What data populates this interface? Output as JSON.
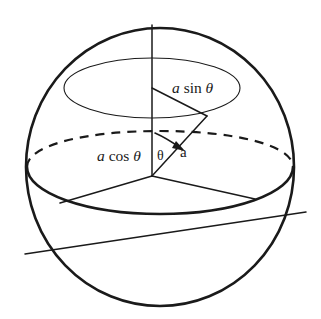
{
  "figure": {
    "kind": "geometry-diagram",
    "background_color": "#ffffff",
    "ink_color": "#1a1a1a",
    "labels": {
      "a_sin_theta": {
        "var1": "a",
        "fn": "sin",
        "var2": "θ",
        "full": "a sin θ"
      },
      "a_cos_theta": {
        "var1": "a",
        "fn": "cos",
        "var2": "θ",
        "full": "a cos θ"
      },
      "theta": {
        "full": "θ"
      },
      "a": {
        "full": "a"
      }
    },
    "parts": {
      "sphere_outline": "sphere-outline-circle",
      "equator_front": "equator-front-arc",
      "equator_back": "equator-back-dashed-arc",
      "latitude_circle": "latitude-circle-ellipse",
      "polar_axis": "vertical-polar-axis",
      "oblique_axis": "oblique-axis-line",
      "radius_to_point": "radius-line-a",
      "latitude_radius": "latitude-radius-line",
      "equatorial_radius": "equatorial-radius-line",
      "angle_arc": "theta-angle-arrow"
    }
  }
}
